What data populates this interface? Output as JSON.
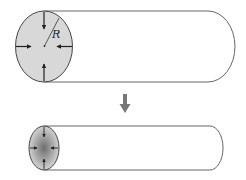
{
  "diagram": {
    "top_cylinder": {
      "radius_label": "R",
      "cross_section_fill": "#d6d6d6",
      "outline_color": "#555555"
    },
    "transition_arrow": {
      "direction": "down",
      "color": "#777777"
    },
    "bottom_cylinder": {
      "cross_section_fill_center": "#777777",
      "cross_section_fill_edge": "#cfcfcf",
      "outline_color": "#555555"
    }
  }
}
